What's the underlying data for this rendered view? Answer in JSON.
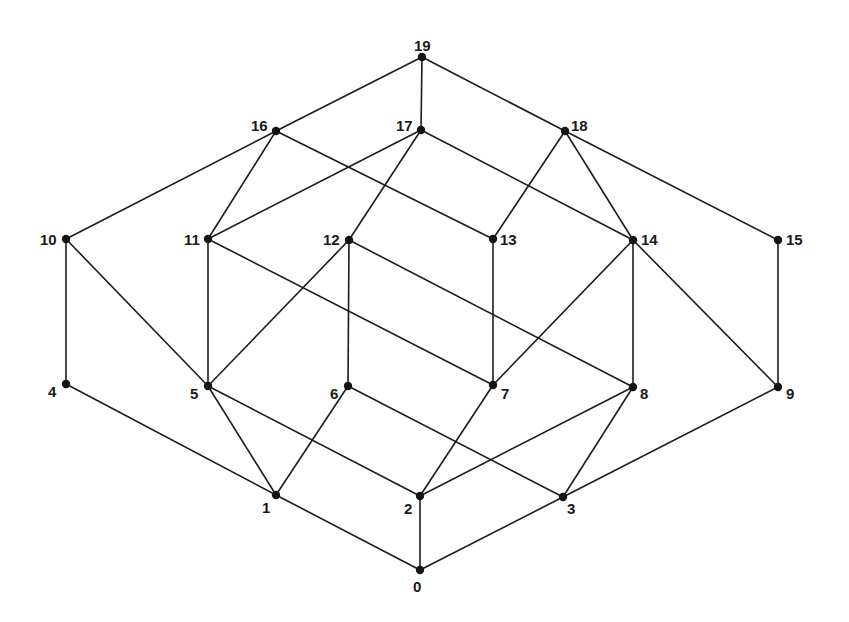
{
  "diagram": {
    "type": "lattice / Hasse diagram",
    "ink_color": "#1a1a1a",
    "background": "#ffffff",
    "nodes": [
      {
        "id": "0",
        "label": "0",
        "x": 420,
        "y": 570,
        "lx": 413,
        "ly": 592
      },
      {
        "id": "1",
        "label": "1",
        "x": 276,
        "y": 495,
        "lx": 262,
        "ly": 513
      },
      {
        "id": "2",
        "label": "2",
        "x": 420,
        "y": 496,
        "lx": 404,
        "ly": 514
      },
      {
        "id": "3",
        "label": "3",
        "x": 563,
        "y": 497,
        "lx": 567,
        "ly": 514
      },
      {
        "id": "4",
        "label": "4",
        "x": 66,
        "y": 384,
        "lx": 48,
        "ly": 397
      },
      {
        "id": "5",
        "label": "5",
        "x": 208,
        "y": 386,
        "lx": 190,
        "ly": 399
      },
      {
        "id": "6",
        "label": "6",
        "x": 348,
        "y": 386,
        "lx": 330,
        "ly": 399
      },
      {
        "id": "7",
        "label": "7",
        "x": 493,
        "y": 385,
        "lx": 501,
        "ly": 399
      },
      {
        "id": "8",
        "label": "8",
        "x": 633,
        "y": 387,
        "lx": 640,
        "ly": 399
      },
      {
        "id": "9",
        "label": "9",
        "x": 778,
        "y": 387,
        "lx": 786,
        "ly": 399
      },
      {
        "id": "10",
        "label": "10",
        "x": 66,
        "y": 239,
        "lx": 40,
        "ly": 245
      },
      {
        "id": "11",
        "label": "11",
        "x": 208,
        "y": 239,
        "lx": 184,
        "ly": 245
      },
      {
        "id": "12",
        "label": "12",
        "x": 349,
        "y": 240,
        "lx": 323,
        "ly": 245
      },
      {
        "id": "13",
        "label": "13",
        "x": 493,
        "y": 239,
        "lx": 500,
        "ly": 245
      },
      {
        "id": "14",
        "label": "14",
        "x": 633,
        "y": 240,
        "lx": 641,
        "ly": 245
      },
      {
        "id": "15",
        "label": "15",
        "x": 778,
        "y": 240,
        "lx": 786,
        "ly": 245
      },
      {
        "id": "16",
        "label": "16",
        "x": 276,
        "y": 131,
        "lx": 251,
        "ly": 131
      },
      {
        "id": "17",
        "label": "17",
        "x": 421,
        "y": 130,
        "lx": 396,
        "ly": 131
      },
      {
        "id": "18",
        "label": "18",
        "x": 565,
        "y": 131,
        "lx": 571,
        "ly": 131
      },
      {
        "id": "19",
        "label": "19",
        "x": 422,
        "y": 57,
        "lx": 414,
        "ly": 51
      }
    ],
    "edges": [
      [
        "19",
        "16"
      ],
      [
        "19",
        "17"
      ],
      [
        "19",
        "18"
      ],
      [
        "16",
        "10"
      ],
      [
        "16",
        "11"
      ],
      [
        "16",
        "13"
      ],
      [
        "17",
        "11"
      ],
      [
        "17",
        "12"
      ],
      [
        "17",
        "14"
      ],
      [
        "18",
        "13"
      ],
      [
        "18",
        "14"
      ],
      [
        "18",
        "15"
      ],
      [
        "10",
        "4"
      ],
      [
        "10",
        "5"
      ],
      [
        "11",
        "5"
      ],
      [
        "11",
        "7"
      ],
      [
        "12",
        "5"
      ],
      [
        "12",
        "6"
      ],
      [
        "12",
        "8"
      ],
      [
        "13",
        "7"
      ],
      [
        "14",
        "7"
      ],
      [
        "14",
        "8"
      ],
      [
        "14",
        "9"
      ],
      [
        "15",
        "9"
      ],
      [
        "4",
        "1"
      ],
      [
        "5",
        "1"
      ],
      [
        "5",
        "2"
      ],
      [
        "6",
        "1"
      ],
      [
        "6",
        "3"
      ],
      [
        "7",
        "2"
      ],
      [
        "8",
        "2"
      ],
      [
        "8",
        "3"
      ],
      [
        "9",
        "3"
      ],
      [
        "1",
        "0"
      ],
      [
        "2",
        "0"
      ],
      [
        "3",
        "0"
      ]
    ]
  }
}
